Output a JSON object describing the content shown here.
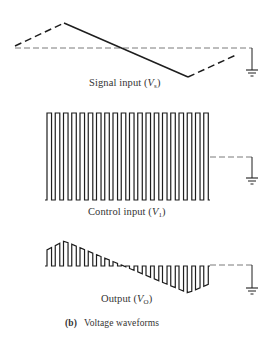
{
  "figure": {
    "caption_tag": "(b)",
    "caption_text": "Voltage waveforms"
  },
  "panels": [
    {
      "id": "signal",
      "label_text": "Signal input (",
      "label_symbol": "V",
      "label_subscript": "s",
      "label_close": ")",
      "waveform": "triangle",
      "baseline_y": 48,
      "dashed_start": [
        [
          15,
          46
        ],
        [
          64,
          23
        ]
      ],
      "solid": [
        [
          64,
          23
        ],
        [
          188,
          77
        ]
      ],
      "dashed_end": [
        [
          188,
          77
        ],
        [
          236,
          55
        ]
      ],
      "ground_x": 252,
      "ground_y": 70
    },
    {
      "id": "control",
      "label_text": "Control input (",
      "label_symbol": "V",
      "label_subscript": "1",
      "label_close": ")",
      "waveform": "square",
      "x_start": 45,
      "x_end": 210,
      "top_y": 113,
      "bottom_y": 200,
      "pulse_count": 20,
      "baseline_y": 157,
      "ground_x": 252,
      "ground_y": 178
    },
    {
      "id": "output",
      "label_text": "Output (",
      "label_symbol": "V",
      "label_subscript": "O",
      "label_close": ")",
      "waveform": "chopped",
      "x_start": 45,
      "x_end": 210,
      "baseline_y": 266,
      "pulse_count": 20,
      "envelope_peak_x": 64,
      "envelope_peak_y": 241,
      "envelope_trough_x": 188,
      "envelope_trough_y": 293,
      "ground_x": 252,
      "ground_y": 288
    }
  ],
  "colors": {
    "stroke": "#1e1e1e",
    "dash": "#7a7a7a",
    "text": "#333333"
  }
}
